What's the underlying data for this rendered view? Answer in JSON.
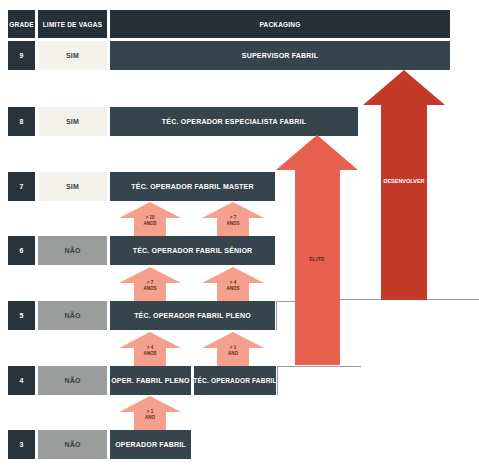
{
  "header": {
    "grade_label": "GRADE",
    "limit_label": "LIMITE DE VAGAS",
    "area_label": "PACKAGING"
  },
  "rows": [
    {
      "grade": "9",
      "limit": "SIM",
      "roles": [
        "SUPERVISOR FABRIL"
      ]
    },
    {
      "grade": "8",
      "limit": "SIM",
      "roles": [
        "TÉC. OPERADOR ESPECIALISTA FABRIL"
      ]
    },
    {
      "grade": "7",
      "limit": "SIM",
      "roles": [
        "TÉC. OPERADOR FABRIL MASTER"
      ]
    },
    {
      "grade": "6",
      "limit": "NÃO",
      "roles": [
        "TÉC. OPERADOR FABRIL SÊNIOR"
      ]
    },
    {
      "grade": "5",
      "limit": "NÃO",
      "roles": [
        "TÉC. OPERADOR FABRIL PLENO"
      ]
    },
    {
      "grade": "4",
      "limit": "NÃO",
      "roles": [
        "OPER. FABRIL PLENO",
        "TÉC. OPERADOR FABRIL"
      ]
    },
    {
      "grade": "3",
      "limit": "NÃO",
      "roles": [
        "OPERADOR FABRIL"
      ]
    }
  ],
  "progression_arrows": [
    {
      "label": "> 10\nANOS",
      "from": "6-left",
      "to": "7"
    },
    {
      "label": "> 7\nANOS",
      "from": "6-right",
      "to": "7"
    },
    {
      "label": "> 7\nANOS",
      "from": "5-left",
      "to": "6"
    },
    {
      "label": "> 4\nANOS",
      "from": "5-right",
      "to": "6"
    },
    {
      "label": "> 4\nANOS",
      "from": "4-left",
      "to": "5"
    },
    {
      "label": "> 1\nANO",
      "from": "4-right",
      "to": "5"
    },
    {
      "label": "> 1\nANO",
      "from": "3",
      "to": "4-left"
    }
  ],
  "tracks": [
    {
      "label": "ELITE",
      "color": "#e8604f",
      "from_grade": "4",
      "to_grade": "8"
    },
    {
      "label": "DESENVOLVER",
      "color": "#c33a2a",
      "from_grade": "5",
      "to_grade": "9"
    }
  ],
  "colors": {
    "role_box": "#36444d",
    "header": "#263039",
    "sim_bg": "#f3f2ed",
    "nao_bg": "#9a9d9c",
    "small_arrow": "#f5a08c",
    "elite_arrow": "#e8604f",
    "develop_arrow": "#c33a2a"
  }
}
